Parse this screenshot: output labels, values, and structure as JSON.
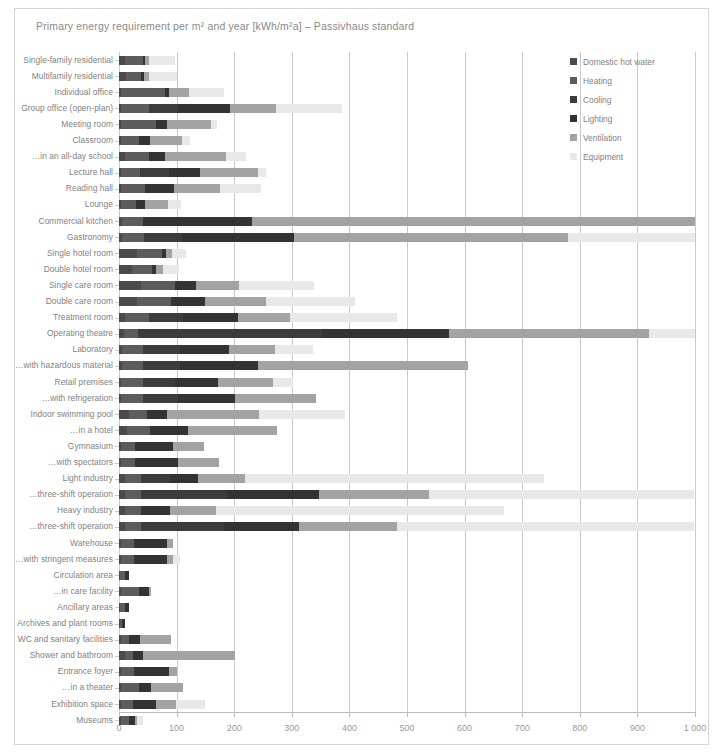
{
  "chart_data": {
    "type": "bar",
    "orientation": "horizontal",
    "stacked": true,
    "title": "Primary energy requirement per m² and year [kWh/m²a] – Passivhaus standard",
    "xlabel": "",
    "ylabel": "",
    "xlim": [
      0,
      1000
    ],
    "xticks": [
      0,
      100,
      200,
      300,
      400,
      500,
      600,
      700,
      800,
      900,
      1000
    ],
    "xtick_labels": [
      "0",
      "100",
      "200",
      "300",
      "400",
      "500",
      "600",
      "700",
      "800",
      "900",
      "1 000"
    ],
    "grid": true,
    "legend_position": "top-right",
    "series": [
      {
        "name": "Domestic hot water",
        "color": "#4a4a4a"
      },
      {
        "name": "Heating",
        "color": "#5c5c5c"
      },
      {
        "name": "Cooling",
        "color": "#3c3c3c"
      },
      {
        "name": "Lighting",
        "color": "#333333"
      },
      {
        "name": "Ventilation",
        "color": "#a3a3a3"
      },
      {
        "name": "Equipment",
        "color": "#e8e8e8"
      }
    ],
    "categories": [
      "Single-family residential",
      "Multifamily residential",
      "Individual office",
      "Group office (open-plan)",
      "Meeting room",
      "Classroom",
      "…in an all-day school",
      "Lecture hall",
      "Reading hall",
      "Lounge",
      "Commercial kitchen",
      "Gastronomy",
      "Single hotel room",
      "Double hotel room",
      "Single care room",
      "Double care room",
      "Treatment room",
      "Operating theatre",
      "Laboratory",
      "…with hazardous material",
      "Retail premises",
      "…with refrigeration",
      "Indoor swimming pool",
      "…in a hotel",
      "Gymnasium",
      "…with spectators",
      "Light industry",
      "…three-shift operation",
      "Heavy industry",
      "…three-shift operation",
      "Warehouse",
      "…with stringent measures",
      "Circulation area",
      "…in care facility",
      "Ancillary areas",
      "Archives and plant rooms",
      "WC and sanitary facilities",
      "Shower and bathroom",
      "Entrance foyer",
      "…in a theater",
      "Exhibition space",
      "Museums"
    ],
    "rows": [
      {
        "category": "Single-family residential",
        "values": [
          10,
          32,
          0,
          4,
          6,
          45
        ],
        "total": 97
      },
      {
        "category": "Multifamily residential",
        "values": [
          13,
          26,
          0,
          4,
          9,
          48
        ],
        "total": 100
      },
      {
        "category": "Individual office",
        "values": [
          4,
          76,
          0,
          6,
          35,
          62
        ],
        "total": 183
      },
      {
        "category": "Group office (open-plan)",
        "values": [
          4,
          48,
          50,
          90,
          80,
          115
        ],
        "total": 387
      },
      {
        "category": "Meeting room",
        "values": [
          4,
          60,
          0,
          20,
          75,
          12
        ],
        "total": 171
      },
      {
        "category": "Classroom",
        "values": [
          4,
          30,
          0,
          20,
          55,
          15
        ],
        "total": 124
      },
      {
        "category": "…in an all-day school",
        "values": [
          10,
          42,
          0,
          28,
          105,
          35
        ],
        "total": 220
      },
      {
        "category": "Lecture hall",
        "values": [
          4,
          32,
          50,
          55,
          100,
          15
        ],
        "total": 256
      },
      {
        "category": "Reading hall",
        "values": [
          4,
          42,
          0,
          50,
          80,
          70
        ],
        "total": 246
      },
      {
        "category": "Lounge",
        "values": [
          4,
          26,
          0,
          15,
          40,
          22
        ],
        "total": 107
      },
      {
        "category": "Commercial kitchen",
        "values": [
          6,
          35,
          0,
          190,
          769,
          0
        ],
        "total": 1000
      },
      {
        "category": "Gastronomy",
        "values": [
          6,
          38,
          65,
          195,
          476,
          220
        ],
        "total": 1000
      },
      {
        "category": "Single hotel room",
        "values": [
          32,
          42,
          0,
          8,
          10,
          24
        ],
        "total": 116
      },
      {
        "category": "Double hotel room",
        "values": [
          22,
          35,
          0,
          8,
          12,
          28
        ],
        "total": 105
      },
      {
        "category": "Single care room",
        "values": [
          38,
          60,
          0,
          35,
          75,
          130
        ],
        "total": 338
      },
      {
        "category": "Double care room",
        "values": [
          32,
          58,
          0,
          60,
          105,
          155
        ],
        "total": 410
      },
      {
        "category": "Treatment room",
        "values": [
          10,
          42,
          60,
          95,
          90,
          185
        ],
        "total": 482
      },
      {
        "category": "Operating theatre",
        "values": [
          8,
          25,
          320,
          220,
          347,
          80
        ],
        "total": 1000
      },
      {
        "category": "Laboratory",
        "values": [
          6,
          35,
          65,
          85,
          80,
          65
        ],
        "total": 336
      },
      {
        "category": "…with hazardous material",
        "values": [
          6,
          35,
          65,
          135,
          365,
          0
        ],
        "total": 606
      },
      {
        "category": "Retail premises",
        "values": [
          4,
          38,
          55,
          75,
          95,
          35
        ],
        "total": 302
      },
      {
        "category": "…with refrigeration",
        "values": [
          4,
          38,
          60,
          100,
          140,
          0
        ],
        "total": 342
      },
      {
        "category": "Indoor swimming pool",
        "values": [
          18,
          30,
          0,
          35,
          160,
          150
        ],
        "total": 393
      },
      {
        "category": "…in a hotel",
        "values": [
          14,
          40,
          0,
          65,
          155,
          0
        ],
        "total": 274
      },
      {
        "category": "Gymnasium",
        "values": [
          4,
          24,
          0,
          65,
          55,
          0
        ],
        "total": 148
      },
      {
        "category": "…with spectators",
        "values": [
          4,
          24,
          0,
          75,
          70,
          0
        ],
        "total": 173
      },
      {
        "category": "Light industry",
        "values": [
          10,
          28,
          50,
          50,
          80,
          520
        ],
        "total": 738
      },
      {
        "category": "…three-shift operation",
        "values": [
          10,
          28,
          150,
          160,
          190,
          460
        ],
        "total": 998
      },
      {
        "category": "Heavy industry",
        "values": [
          10,
          28,
          0,
          50,
          80,
          500
        ],
        "total": 668
      },
      {
        "category": "…three-shift operation",
        "values": [
          10,
          28,
          145,
          130,
          170,
          515
        ],
        "total": 998
      },
      {
        "category": "Warehouse",
        "values": [
          4,
          22,
          0,
          58,
          10,
          0
        ],
        "total": 94
      },
      {
        "category": "…with stringent measures",
        "values": [
          4,
          22,
          0,
          58,
          10,
          12
        ],
        "total": 106
      },
      {
        "category": "Circulation area",
        "values": [
          2,
          8,
          0,
          8,
          0,
          0
        ],
        "total": 18
      },
      {
        "category": "…in care facility",
        "values": [
          4,
          30,
          0,
          18,
          4,
          0
        ],
        "total": 56
      },
      {
        "category": "Ancillary areas",
        "values": [
          2,
          8,
          0,
          8,
          0,
          0
        ],
        "total": 18
      },
      {
        "category": "Archives and plant rooms",
        "values": [
          2,
          4,
          0,
          4,
          0,
          0
        ],
        "total": 10
      },
      {
        "category": "WC and sanitary facilities",
        "values": [
          4,
          14,
          0,
          18,
          55,
          0
        ],
        "total": 91
      },
      {
        "category": "Shower and bathroom",
        "values": [
          10,
          14,
          0,
          18,
          160,
          0
        ],
        "total": 202
      },
      {
        "category": "Entrance foyer",
        "values": [
          4,
          22,
          0,
          60,
          14,
          0
        ],
        "total": 100
      },
      {
        "category": "…in a theater",
        "values": [
          4,
          30,
          0,
          22,
          55,
          0
        ],
        "total": 111
      },
      {
        "category": "Exhibition space",
        "values": [
          4,
          20,
          0,
          40,
          35,
          50
        ],
        "total": 149
      },
      {
        "category": "Museums",
        "values": [
          4,
          14,
          0,
          10,
          4,
          10
        ],
        "total": 42
      }
    ]
  },
  "legend": {
    "items": [
      {
        "label": "Domestic hot water",
        "color": "#4a4a4a"
      },
      {
        "label": "Heating",
        "color": "#5c5c5c"
      },
      {
        "label": "Cooling",
        "color": "#3c3c3c"
      },
      {
        "label": "Lighting",
        "color": "#333333"
      },
      {
        "label": "Ventilation",
        "color": "#a3a3a3"
      },
      {
        "label": "Equipment",
        "color": "#e8e8e8"
      }
    ]
  },
  "colors": {
    "background": "#ffffff",
    "frame": "#d5d5d5",
    "grid": "#c9c9c9",
    "axis": "#bdbdbd",
    "text": "#818181",
    "title": "#8a8a8a"
  }
}
